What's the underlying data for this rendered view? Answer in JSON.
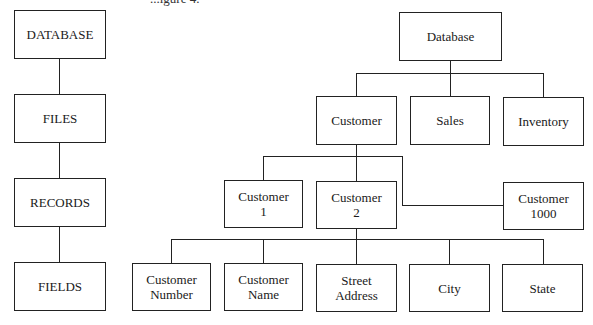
{
  "caption": "...igure 4.",
  "left_hierarchy": {
    "levels": [
      {
        "label": "DATABASE"
      },
      {
        "label": "FILES"
      },
      {
        "label": "RECORDS"
      },
      {
        "label": "FIELDS"
      }
    ]
  },
  "right_tree": {
    "root": {
      "label": "Database"
    },
    "files": [
      {
        "label": "Customer"
      },
      {
        "label": "Sales"
      },
      {
        "label": "Inventory"
      }
    ],
    "records": [
      {
        "label": "Customer\n1"
      },
      {
        "label": "Customer\n2"
      },
      {
        "label": "Customer\n1000"
      }
    ],
    "fields": [
      {
        "label": "Customer\nNumber"
      },
      {
        "label": "Customer\nName"
      },
      {
        "label": "Street\nAddress"
      },
      {
        "label": "City"
      },
      {
        "label": "State"
      }
    ]
  }
}
